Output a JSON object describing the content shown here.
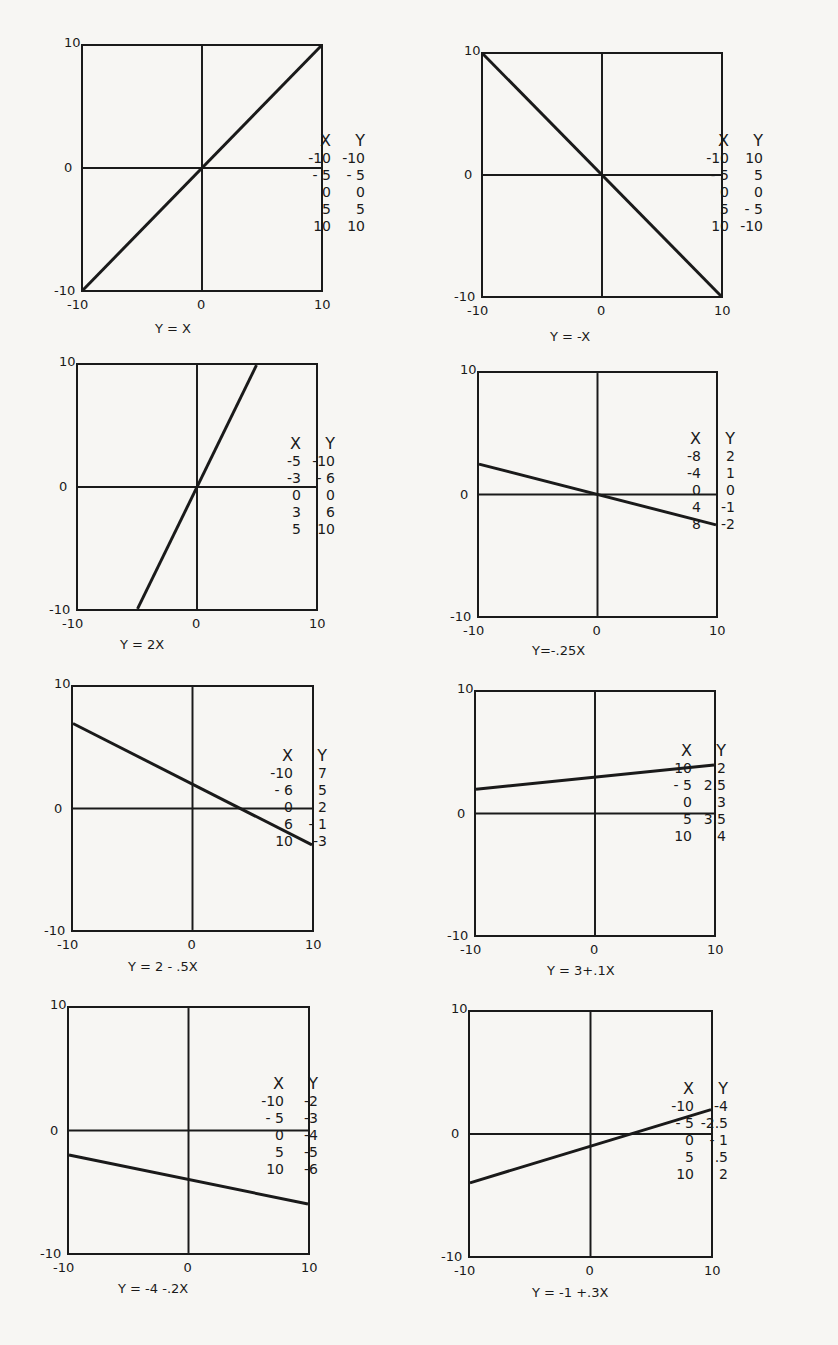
{
  "chart_data": [
    {
      "type": "line",
      "title": "Y = X",
      "xlim": [
        -10,
        10
      ],
      "ylim": [
        -10,
        10
      ],
      "x_ticks": [
        "-10",
        "0",
        "10"
      ],
      "y_ticks": [
        "10",
        "0",
        "-10"
      ],
      "table_headers": [
        "X",
        "Y"
      ],
      "table": [
        [
          "-10",
          "-10"
        ],
        [
          "- 5",
          "- 5"
        ],
        [
          "0",
          "0"
        ],
        [
          "5",
          "5"
        ],
        [
          "10",
          "10"
        ]
      ],
      "line": {
        "x": [
          -10,
          10
        ],
        "y": [
          -10,
          10
        ]
      }
    },
    {
      "type": "line",
      "title": "Y = -X",
      "xlim": [
        -10,
        10
      ],
      "ylim": [
        -10,
        10
      ],
      "x_ticks": [
        "-10",
        "0",
        "10"
      ],
      "y_ticks": [
        "10",
        "0",
        "-10"
      ],
      "table_headers": [
        "X",
        "Y"
      ],
      "table": [
        [
          "-10",
          "10"
        ],
        [
          "- 5",
          "5"
        ],
        [
          "0",
          "0"
        ],
        [
          "5",
          "- 5"
        ],
        [
          "10",
          "-10"
        ]
      ],
      "line": {
        "x": [
          -10,
          10
        ],
        "y": [
          10,
          -10
        ]
      }
    },
    {
      "type": "line",
      "title": "Y = 2X",
      "xlim": [
        -10,
        10
      ],
      "ylim": [
        -10,
        10
      ],
      "x_ticks": [
        "-10",
        "0",
        "10"
      ],
      "y_ticks": [
        "10",
        "0",
        "-10"
      ],
      "table_headers": [
        "X",
        "Y"
      ],
      "table": [
        [
          "-5",
          "-10"
        ],
        [
          "-3",
          "- 6"
        ],
        [
          "0",
          "0"
        ],
        [
          "3",
          "6"
        ],
        [
          "5",
          "10"
        ]
      ],
      "line": {
        "x": [
          -5,
          5
        ],
        "y": [
          -10,
          10
        ]
      }
    },
    {
      "type": "line",
      "title": "Y=-.25X",
      "xlim": [
        -10,
        10
      ],
      "ylim": [
        -10,
        10
      ],
      "x_ticks": [
        "-10",
        "0",
        "10"
      ],
      "y_ticks": [
        "10",
        "0",
        "-10"
      ],
      "table_headers": [
        "X",
        "Y"
      ],
      "table": [
        [
          "-8",
          "2"
        ],
        [
          "-4",
          "1"
        ],
        [
          "0",
          "0"
        ],
        [
          "4",
          "-1"
        ],
        [
          "8",
          "-2"
        ]
      ],
      "line": {
        "x": [
          -10,
          10
        ],
        "y": [
          2.5,
          -2.5
        ]
      }
    },
    {
      "type": "line",
      "title": "Y = 2 - .5X",
      "xlim": [
        -10,
        10
      ],
      "ylim": [
        -10,
        10
      ],
      "x_ticks": [
        "-10",
        "0",
        "10"
      ],
      "y_ticks": [
        "10",
        "0",
        "-10"
      ],
      "table_headers": [
        "X",
        "Y"
      ],
      "table": [
        [
          "-10",
          "7"
        ],
        [
          "- 6",
          "5"
        ],
        [
          "0",
          "2"
        ],
        [
          "6",
          "- 1"
        ],
        [
          "10",
          "-3"
        ]
      ],
      "line": {
        "x": [
          -10,
          10
        ],
        "y": [
          7,
          -3
        ]
      }
    },
    {
      "type": "line",
      "title": "Y = 3+.1X",
      "xlim": [
        -10,
        10
      ],
      "ylim": [
        -10,
        10
      ],
      "x_ticks": [
        "-10",
        "0",
        "10"
      ],
      "y_ticks": [
        "10",
        "0",
        "-10"
      ],
      "table_headers": [
        "X",
        "Y"
      ],
      "table": [
        [
          "-10",
          "2"
        ],
        [
          "- 5",
          "2.5"
        ],
        [
          "0",
          "3"
        ],
        [
          "5",
          "3.5"
        ],
        [
          "10",
          "4"
        ]
      ],
      "line": {
        "x": [
          -10,
          10
        ],
        "y": [
          2,
          4
        ]
      }
    },
    {
      "type": "line",
      "title": "Y = -4 -.2X",
      "xlim": [
        -10,
        10
      ],
      "ylim": [
        -10,
        10
      ],
      "x_ticks": [
        "-10",
        "0",
        "10"
      ],
      "y_ticks": [
        "10",
        "0",
        "-10"
      ],
      "table_headers": [
        "X",
        "Y"
      ],
      "table": [
        [
          "-10",
          "-2"
        ],
        [
          "- 5",
          "-3"
        ],
        [
          "0",
          "-4"
        ],
        [
          "5",
          "-5"
        ],
        [
          "10",
          "-6"
        ]
      ],
      "line": {
        "x": [
          -10,
          10
        ],
        "y": [
          -2,
          -6
        ]
      }
    },
    {
      "type": "line",
      "title": "Y = -1 +.3X",
      "xlim": [
        -10,
        10
      ],
      "ylim": [
        -10,
        10
      ],
      "x_ticks": [
        "-10",
        "0",
        "10"
      ],
      "y_ticks": [
        "10",
        "0",
        "-10"
      ],
      "table_headers": [
        "X",
        "Y"
      ],
      "table": [
        [
          "-10",
          "-4"
        ],
        [
          "- 5",
          "-2.5"
        ],
        [
          "0",
          "- 1"
        ],
        [
          "5",
          ".5"
        ],
        [
          "10",
          "2"
        ]
      ],
      "line": {
        "x": [
          -10,
          10
        ],
        "y": [
          -4,
          2
        ]
      }
    }
  ]
}
